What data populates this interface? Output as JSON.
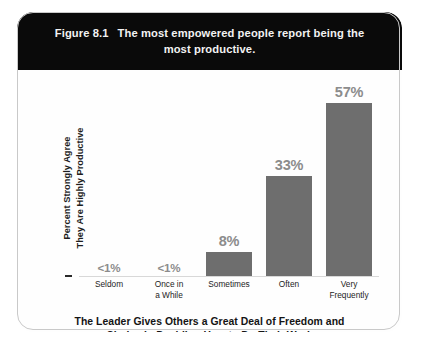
{
  "figure": {
    "number": "Figure 8.1",
    "title_line1": "The most empowered people report being the",
    "title_line2": "most productive."
  },
  "axes": {
    "y_label_line1": "Percent Strongly Agree",
    "y_label_line2": "They Are Highly Productive",
    "x_title_line1": "The Leader Gives Others a Great Deal of Freedom and",
    "x_title_line2": "Choice in Deciding How to Do Their Work"
  },
  "colors": {
    "header_background": "#0a0a0a",
    "header_text": "#f2f2f2",
    "bar_fill": "#6e6e6e",
    "value_label": "#8c8c8c",
    "panel_border": "#c9c9c9"
  },
  "chart_data": {
    "type": "bar",
    "title": "The most empowered people report being the most productive.",
    "xlabel": "The Leader Gives Others a Great Deal of Freedom and Choice in Deciding How to Do Their Work",
    "ylabel": "Percent Strongly Agree They Are Highly Productive",
    "categories": [
      "Seldom",
      "Once in a While",
      "Sometimes",
      "Often",
      "Very Frequently"
    ],
    "category_lines": [
      [
        "Seldom"
      ],
      [
        "Once in",
        "a While"
      ],
      [
        "Sometimes"
      ],
      [
        "Often"
      ],
      [
        "Very",
        "Frequently"
      ]
    ],
    "values": [
      0.5,
      0.5,
      8,
      33,
      57
    ],
    "value_labels": [
      "<1%",
      "<1%",
      "8%",
      "33%",
      "57%"
    ],
    "ylim": [
      0,
      62
    ],
    "grid": false,
    "legend": false
  }
}
